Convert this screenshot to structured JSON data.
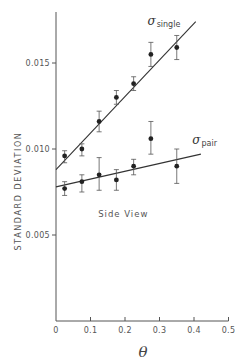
{
  "chart_data": {
    "type": "scatter",
    "title": "",
    "xlabel": "θ",
    "ylabel": "STANDARD DEVIATION",
    "xlim": [
      0,
      0.5
    ],
    "ylim": [
      0,
      0.0185
    ],
    "xticks": [
      0,
      0.1,
      0.2,
      0.3,
      0.4,
      0.5
    ],
    "xtick_labels": [
      "0",
      "0.1",
      "0.2",
      "0.3",
      "0.4",
      "0.5"
    ],
    "yticks": [
      0.005,
      0.01,
      0.015
    ],
    "ytick_labels": [
      "0.005",
      "0.010",
      "0.015"
    ],
    "grid": false,
    "legend": "none (series labeled inline)",
    "annotations": [
      {
        "text": "Side View",
        "x": 0.125,
        "y": 0.0062
      }
    ],
    "series": [
      {
        "name": "σ_single",
        "label_main": "σ",
        "label_sub": "single",
        "label_pos": {
          "x": 0.265,
          "y": 0.0172
        },
        "x": [
          0.025,
          0.075,
          0.125,
          0.175,
          0.225,
          0.275,
          0.35
        ],
        "values": [
          0.0096,
          0.01,
          0.0116,
          0.013,
          0.0138,
          0.0155,
          0.0159
        ],
        "err_low": [
          0.0092,
          0.0096,
          0.011,
          0.0126,
          0.0134,
          0.0148,
          0.0152
        ],
        "err_high": [
          0.0099,
          0.0103,
          0.0122,
          0.0134,
          0.0142,
          0.0162,
          0.0166
        ],
        "fit_line": {
          "x": [
            0.0,
            0.405
          ],
          "y": [
            0.0088,
            0.0174
          ]
        }
      },
      {
        "name": "σ_pair",
        "label_main": "σ",
        "label_sub": "pair",
        "label_pos": {
          "x": 0.395,
          "y": 0.0103
        },
        "x": [
          0.025,
          0.075,
          0.125,
          0.175,
          0.225,
          0.275,
          0.35
        ],
        "values": [
          0.0077,
          0.0081,
          0.0085,
          0.0082,
          0.009,
          0.0106,
          0.009
        ],
        "err_low": [
          0.0073,
          0.0075,
          0.0076,
          0.0076,
          0.0085,
          0.0097,
          0.008
        ],
        "err_high": [
          0.0081,
          0.0085,
          0.0095,
          0.0088,
          0.0094,
          0.0116,
          0.01
        ],
        "fit_line": {
          "x": [
            0.0,
            0.42
          ],
          "y": [
            0.0078,
            0.0097
          ]
        }
      }
    ]
  }
}
